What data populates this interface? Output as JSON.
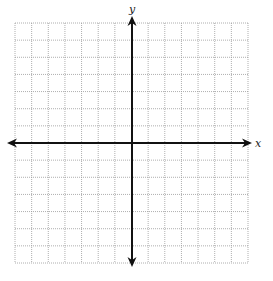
{
  "diagram": {
    "type": "coordinate-grid",
    "labels": {
      "x_axis": "x",
      "y_axis": "y"
    },
    "grid": {
      "columns": 14,
      "rows": 14,
      "left": 15,
      "top": 23,
      "right": 248,
      "bottom": 263,
      "line_color": "#9a9a9a",
      "line_style": "dotted"
    },
    "axes": {
      "color": "#111111",
      "x_axis_y": 143,
      "y_axis_x": 132,
      "x_arrow_start": 7,
      "x_arrow_end": 252,
      "y_arrow_start": 16,
      "y_arrow_end": 267
    }
  }
}
